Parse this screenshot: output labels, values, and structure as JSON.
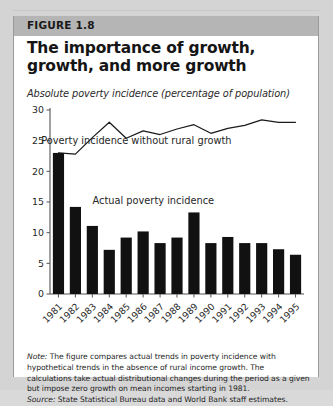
{
  "figure": {
    "label": "FIGURE 1.8",
    "title": "The importance of growth, growth, and more growth",
    "subtitle": "Absolute poverty incidence (percentage of population)",
    "note_label": "Note:",
    "note_text": " The figure compares actual trends in poverty incidence with hypothetical trends in the absence of rural income growth. The calculations take actual distributional changes during the period as a given but impose zero growth on mean incomes starting in 1981.",
    "source_label": "Source:",
    "source_text": " State Statistical Bureau data and World Bank staff estimates."
  },
  "colors": {
    "bar": "#111111",
    "line": "#1a1a1a",
    "axis": "#555555",
    "header_band": "#b5b5b5",
    "card": "#ffffff",
    "page": "#d4d4d4"
  },
  "chart_data": {
    "type": "bar",
    "title": "The importance of growth, growth, and more growth",
    "subtitle": "Absolute poverty incidence (percentage of population)",
    "xlabel": "",
    "ylabel": "",
    "ylim": [
      0,
      30
    ],
    "yticks": [
      0,
      5,
      10,
      15,
      20,
      25,
      30
    ],
    "grid": false,
    "legend_position": "inline-annotation",
    "categories": [
      "1981",
      "1982",
      "1983",
      "1984",
      "1985",
      "1986",
      "1987",
      "1988",
      "1989",
      "1990",
      "1991",
      "1992",
      "1993",
      "1994",
      "1995"
    ],
    "series": [
      {
        "name": "Actual poverty incidence",
        "type": "bar",
        "values": [
          23.0,
          14.2,
          11.1,
          7.2,
          9.2,
          10.2,
          8.3,
          9.2,
          13.3,
          8.3,
          9.3,
          8.3,
          8.3,
          7.3,
          6.4
        ]
      },
      {
        "name": "Poverty incidence without rural growth",
        "type": "line",
        "values": [
          23.0,
          22.8,
          25.5,
          28.0,
          25.4,
          26.6,
          26.0,
          26.9,
          27.6,
          26.2,
          27.0,
          27.5,
          28.4,
          28.0,
          28.0
        ]
      }
    ],
    "annotations": [
      {
        "text": "Poverty incidence without rural growth",
        "x": 4.6,
        "y": 24.4
      },
      {
        "text": "Actual poverty incidence",
        "x": 5.6,
        "y": 14.6
      }
    ]
  }
}
